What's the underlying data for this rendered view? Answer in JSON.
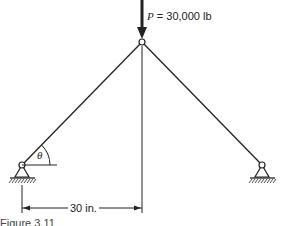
{
  "figure": {
    "load": {
      "symbol": "P",
      "equals": " = 30,000 lb"
    },
    "angle_label": "θ",
    "dimension_label": "30 in.",
    "caption": "Figure 3.11"
  }
}
